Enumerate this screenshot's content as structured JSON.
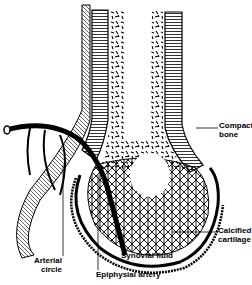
{
  "diagram": {
    "labels": {
      "compact_bone": [
        "Compact",
        "bone"
      ],
      "calcified_cartilage": [
        "Calcified",
        "cartilage"
      ],
      "synovial_fluid": "Synovial fluid",
      "arterial_circle": [
        "Arterial",
        "circle"
      ],
      "epiphysial_artery": "Epiphysial artery"
    },
    "colors": {
      "ink": "#000000",
      "paper": "#ffffff"
    }
  }
}
